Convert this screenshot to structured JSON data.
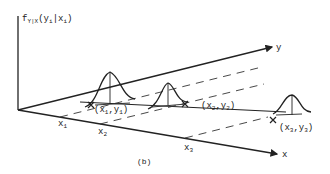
{
  "figure": {
    "caption": "(b)",
    "ylabel": {
      "main": "f",
      "sub": "Y|X",
      "args": "(y",
      "argsub1": "i",
      "mid": "|x",
      "argsub2": "i",
      "close": ")"
    },
    "axes": {
      "y_label": "y",
      "x_label": "x"
    },
    "x_ticks": [
      {
        "base": "x",
        "sub": "1"
      },
      {
        "base": "x",
        "sub": "2"
      },
      {
        "base": "x",
        "sub": "3"
      }
    ],
    "points": [
      {
        "open": "(x",
        "s1": "1",
        "comma": ",y",
        "s2": "1",
        "close": ")"
      },
      {
        "open": "(x",
        "s1": "2",
        "comma": ",y",
        "s2": "2",
        "close": ")"
      },
      {
        "open": "(x",
        "s1": "3",
        "comma": ",y",
        "s2": "3",
        "close": ")"
      }
    ],
    "colors": {
      "ink": "#222222",
      "background": "#ffffff"
    }
  }
}
